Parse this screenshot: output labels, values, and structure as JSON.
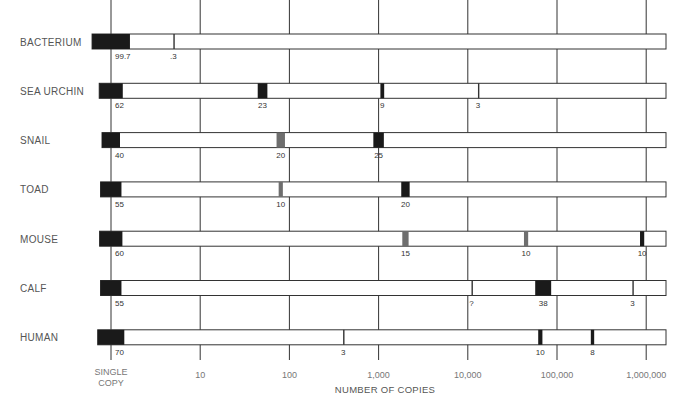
{
  "chart_data": {
    "type": "bar",
    "subtype": "log-scale fraction of DNA by repetition class",
    "title": "",
    "xlabel": "NUMBER OF COPIES",
    "x_scale": "log10",
    "xlim": [
      1,
      1000000
    ],
    "x_ticks": [
      {
        "value": 1,
        "label": "SINGLE COPY"
      },
      {
        "value": 10,
        "label": "10"
      },
      {
        "value": 100,
        "label": "100"
      },
      {
        "value": 1000,
        "label": "1,000"
      },
      {
        "value": 10000,
        "label": "10,000"
      },
      {
        "value": 100000,
        "label": "100,000"
      },
      {
        "value": 1000000,
        "label": "1,000,000"
      }
    ],
    "grid": true,
    "series": [
      {
        "name": "BACTERIUM",
        "segments": [
          {
            "copies": 1,
            "percent_label": "99.7",
            "shade": "black",
            "weight": 99.7
          },
          {
            "copies": 5,
            "percent_label": ".3",
            "shade": "line",
            "weight": 0.3
          }
        ]
      },
      {
        "name": "SEA URCHIN",
        "segments": [
          {
            "copies": 1,
            "percent_label": "62",
            "shade": "black",
            "weight": 62
          },
          {
            "copies": 50,
            "percent_label": "23",
            "shade": "black",
            "weight": 23
          },
          {
            "copies": 1100,
            "percent_label": "9",
            "shade": "black",
            "weight": 9
          },
          {
            "copies": 13000,
            "percent_label": "3",
            "shade": "line",
            "weight": 3
          }
        ]
      },
      {
        "name": "SNAIL",
        "segments": [
          {
            "copies": 1,
            "percent_label": "40",
            "shade": "black",
            "weight": 40
          },
          {
            "copies": 80,
            "percent_label": "20",
            "shade": "gray",
            "weight": 20
          },
          {
            "copies": 1000,
            "percent_label": "25",
            "shade": "black",
            "weight": 25
          }
        ]
      },
      {
        "name": "TOAD",
        "segments": [
          {
            "copies": 1,
            "percent_label": "55",
            "shade": "black",
            "weight": 55
          },
          {
            "copies": 80,
            "percent_label": "10",
            "shade": "gray",
            "weight": 10
          },
          {
            "copies": 2000,
            "percent_label": "20",
            "shade": "black",
            "weight": 20
          }
        ]
      },
      {
        "name": "MOUSE",
        "segments": [
          {
            "copies": 1,
            "percent_label": "60",
            "shade": "black",
            "weight": 60
          },
          {
            "copies": 2000,
            "percent_label": "15",
            "shade": "gray",
            "weight": 15
          },
          {
            "copies": 45000,
            "percent_label": "10",
            "shade": "gray",
            "weight": 10
          },
          {
            "copies": 900000,
            "percent_label": "10",
            "shade": "black",
            "weight": 10
          }
        ]
      },
      {
        "name": "CALF",
        "segments": [
          {
            "copies": 1,
            "percent_label": "55",
            "shade": "black",
            "weight": 55
          },
          {
            "copies": 11000,
            "percent_label": "?",
            "shade": "line",
            "weight": 0
          },
          {
            "copies": 70000,
            "percent_label": "38",
            "shade": "black",
            "weight": 38
          },
          {
            "copies": 700000,
            "percent_label": "3",
            "shade": "line",
            "weight": 3
          }
        ]
      },
      {
        "name": "HUMAN",
        "segments": [
          {
            "copies": 1,
            "percent_label": "70",
            "shade": "black",
            "weight": 70
          },
          {
            "copies": 400,
            "percent_label": "3",
            "shade": "line",
            "weight": 3
          },
          {
            "copies": 65000,
            "percent_label": "10",
            "shade": "black",
            "weight": 10
          },
          {
            "copies": 250000,
            "percent_label": "8",
            "shade": "black",
            "weight": 8
          }
        ]
      }
    ],
    "colors": {
      "black": "#1a1a1a",
      "gray": "#6e6e6e",
      "line": "#333333",
      "grid": "#333333",
      "bar_fill": "#ffffff"
    }
  }
}
